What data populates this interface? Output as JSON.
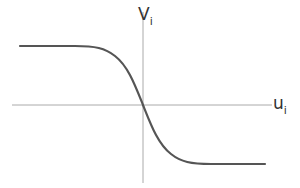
{
  "diagram": {
    "title": "",
    "type": "decreasing sigmoid function plot",
    "axes": {
      "x_label": "u",
      "x_subscript": "i",
      "y_label": "V",
      "y_subscript": "i"
    },
    "curve": {
      "shape": "decreasing sigmoid (negative tanh-like)",
      "left_asymptote": "high",
      "right_asymptote": "low",
      "passes_through_origin": true
    },
    "colors": {
      "axis": "#999999",
      "curve": "#555555",
      "label": "#333333"
    }
  }
}
